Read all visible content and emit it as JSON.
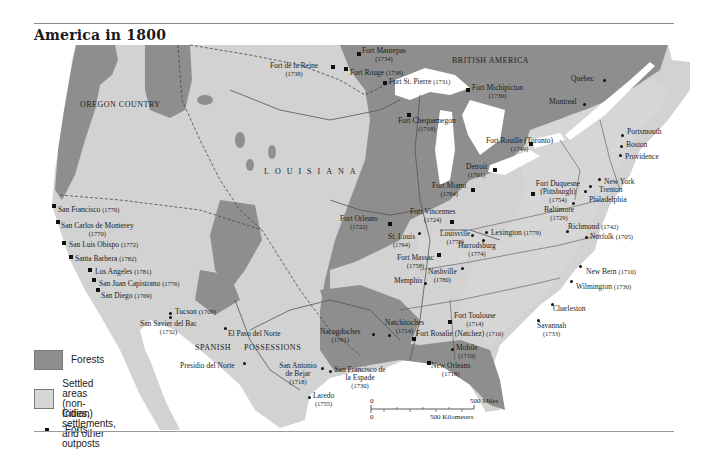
{
  "title": "America in 1800",
  "colors": {
    "forest": "#8e8e8e",
    "settled": "#d4d4d4",
    "land": "#cfcfcf",
    "water": "#ffffff",
    "border": "#555555"
  },
  "regions": {
    "oregon": "OREGON COUNTRY",
    "british": "BRITISH AMERICA",
    "louisiana": "LOUISIANA",
    "spanish1": "SPANISH",
    "spanish2": "POSSESSIONS"
  },
  "places": [
    {
      "name": "Fort Maurepas",
      "year": "(1734)",
      "type": "fort"
    },
    {
      "name": "Fort de la Reine",
      "year": "(1738)",
      "type": "fort"
    },
    {
      "name": "Fort Rouge",
      "year": "(1738)",
      "type": "fort"
    },
    {
      "name": "Fort St. Pierre",
      "year": "(1731)",
      "type": "fort"
    },
    {
      "name": "Fort Michipicton",
      "year": "(1730)",
      "type": "fort"
    },
    {
      "name": "Fort Chequamegon",
      "year": "(1718)",
      "type": "fort"
    },
    {
      "name": "Quebec",
      "year": "",
      "type": "city"
    },
    {
      "name": "Montreal",
      "year": "",
      "type": "city"
    },
    {
      "name": "Portsmouth",
      "year": "",
      "type": "city"
    },
    {
      "name": "Boston",
      "year": "",
      "type": "city"
    },
    {
      "name": "Providence",
      "year": "",
      "type": "city"
    },
    {
      "name": "Fort Rouille (Toronto)",
      "year": "(1749)",
      "type": "fort"
    },
    {
      "name": "Detroit",
      "year": "(1701)",
      "type": "fort"
    },
    {
      "name": "Fort Miami",
      "year": "(1704)",
      "type": "fort"
    },
    {
      "name": "Fort Duquesne (Pittsburgh)",
      "year": "(1754)",
      "type": "fort"
    },
    {
      "name": "New York",
      "year": "",
      "type": "city"
    },
    {
      "name": "Trenton",
      "year": "",
      "type": "city"
    },
    {
      "name": "Philadelphia",
      "year": "",
      "type": "city"
    },
    {
      "name": "Baltimore",
      "year": "(1729)",
      "type": "city"
    },
    {
      "name": "Richmond",
      "year": "(1742)",
      "type": "city"
    },
    {
      "name": "Norfolk",
      "year": "(1705)",
      "type": "city"
    },
    {
      "name": "Fort Vincennes",
      "year": "(1724)",
      "type": "fort"
    },
    {
      "name": "Fort Orleans",
      "year": "(1722)",
      "type": "fort"
    },
    {
      "name": "St. Louis",
      "year": "(1764)",
      "type": "city"
    },
    {
      "name": "Louisville",
      "year": "(1778)",
      "type": "city"
    },
    {
      "name": "Lexington",
      "year": "(1779)",
      "type": "city"
    },
    {
      "name": "Harrodsburg",
      "year": "(1774)",
      "type": "city"
    },
    {
      "name": "Fort Massac",
      "year": "(1758)",
      "type": "fort"
    },
    {
      "name": "Nashville",
      "year": "(1780)",
      "type": "city"
    },
    {
      "name": "Memphis",
      "year": "",
      "type": "city"
    },
    {
      "name": "New Bern",
      "year": "(1710)",
      "type": "city"
    },
    {
      "name": "Wilmington",
      "year": "(1730)",
      "type": "city"
    },
    {
      "name": "Charleston",
      "year": "",
      "type": "city"
    },
    {
      "name": "Savannah",
      "year": "(1733)",
      "type": "city"
    },
    {
      "name": "Fort Toulouse",
      "year": "(1714)",
      "type": "fort"
    },
    {
      "name": "Fort Rosalie (Natchez)",
      "year": "(1716)",
      "type": "fort"
    },
    {
      "name": "Natchitoches",
      "year": "(1714)",
      "type": "city"
    },
    {
      "name": "Nacogdoches",
      "year": "(1791)",
      "type": "city"
    },
    {
      "name": "Mobile",
      "year": "(1710)",
      "type": "city"
    },
    {
      "name": "New Orleans",
      "year": "(1718)",
      "type": "fort"
    },
    {
      "name": "San Antonio de Bejar",
      "year": "(1718)",
      "type": "city"
    },
    {
      "name": "San Francisco de la Espade",
      "year": "(1730)",
      "type": "city"
    },
    {
      "name": "Laredo",
      "year": "(1755)",
      "type": "city"
    },
    {
      "name": "El Paso del Norte",
      "year": "",
      "type": "city"
    },
    {
      "name": "Presidio del Norte",
      "year": "",
      "type": "city"
    },
    {
      "name": "Tucson",
      "year": "(1709)",
      "type": "city"
    },
    {
      "name": "San Savier del Bac",
      "year": "(1732)",
      "type": "city"
    },
    {
      "name": "San Francisco",
      "year": "(1776)",
      "type": "fort"
    },
    {
      "name": "San Carlos de Monterey",
      "year": "(1770)",
      "type": "fort"
    },
    {
      "name": "San Luis Obispo",
      "year": "(1772)",
      "type": "fort"
    },
    {
      "name": "Santa Barbera",
      "year": "(1782)",
      "type": "fort"
    },
    {
      "name": "Los Angeles",
      "year": "(1781)",
      "type": "fort"
    },
    {
      "name": "San Juan Capistrano",
      "year": "(1776)",
      "type": "fort"
    },
    {
      "name": "San Diego",
      "year": "(1769)",
      "type": "fort"
    }
  ],
  "legend": {
    "forests": "Forests",
    "settled_line1": "Settled areas",
    "settled_line2": "(non-Indian)",
    "cities": "Cities, settlements, and other outposts",
    "forts": "Forts"
  },
  "scale": {
    "zero_top": "0",
    "zero_bottom": "0",
    "miles": "500 Miles",
    "km": "500 Kilometers"
  }
}
